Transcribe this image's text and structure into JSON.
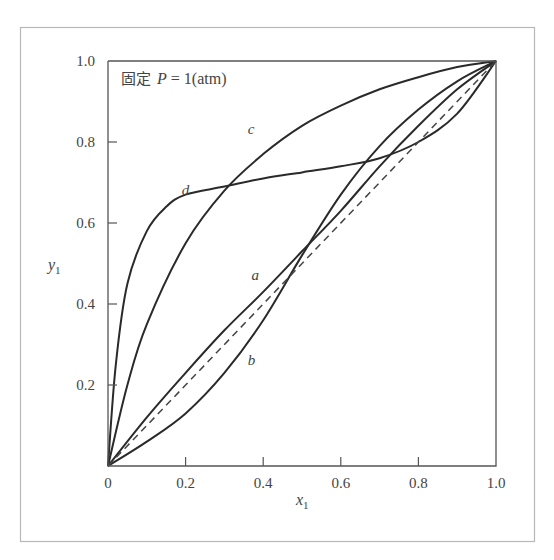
{
  "chart_data": {
    "type": "line",
    "title": "",
    "annotation": {
      "prefix": "固定",
      "variable": "P",
      "equals": " = ",
      "value": "1(atm)"
    },
    "xlabel": "x",
    "xlabel_sub": "1",
    "ylabel": "y",
    "ylabel_sub": "1",
    "xlim": [
      0,
      1.0
    ],
    "ylim": [
      0,
      1.0
    ],
    "x_ticks": [
      "0",
      "0.2",
      "0.4",
      "0.6",
      "0.8",
      "1.0"
    ],
    "y_ticks": [
      "0.2",
      "0.4",
      "0.6",
      "0.8",
      "1.0"
    ],
    "grid": false,
    "legend": "inline curve labels",
    "series": [
      {
        "name": "a",
        "style": "solid",
        "x": [
          0,
          0.1,
          0.2,
          0.3,
          0.4,
          0.5,
          0.6,
          0.7,
          0.8,
          0.9,
          1.0
        ],
        "y": [
          0,
          0.12,
          0.23,
          0.335,
          0.43,
          0.53,
          0.63,
          0.74,
          0.84,
          0.93,
          1.0
        ]
      },
      {
        "name": "b",
        "style": "solid",
        "x": [
          0,
          0.1,
          0.2,
          0.3,
          0.4,
          0.5,
          0.6,
          0.7,
          0.8,
          0.9,
          1.0
        ],
        "y": [
          0,
          0.06,
          0.13,
          0.23,
          0.36,
          0.52,
          0.67,
          0.79,
          0.88,
          0.95,
          1.0
        ]
      },
      {
        "name": "c",
        "style": "solid",
        "x": [
          0,
          0.05,
          0.1,
          0.2,
          0.3,
          0.4,
          0.5,
          0.6,
          0.7,
          0.8,
          0.9,
          1.0
        ],
        "y": [
          0,
          0.2,
          0.35,
          0.55,
          0.68,
          0.77,
          0.84,
          0.89,
          0.93,
          0.96,
          0.985,
          1.0
        ]
      },
      {
        "name": "d",
        "style": "solid",
        "x": [
          0,
          0.02,
          0.05,
          0.1,
          0.15,
          0.2,
          0.3,
          0.4,
          0.5,
          0.6,
          0.7,
          0.8,
          0.9,
          1.0
        ],
        "y": [
          0,
          0.25,
          0.45,
          0.58,
          0.64,
          0.67,
          0.69,
          0.71,
          0.725,
          0.74,
          0.76,
          0.8,
          0.87,
          1.0
        ]
      },
      {
        "name": "y=x",
        "style": "dashed",
        "x": [
          0,
          1.0
        ],
        "y": [
          0,
          1.0
        ]
      }
    ],
    "curve_labels": [
      {
        "text": "a",
        "x": 0.37,
        "y": 0.46
      },
      {
        "text": "b",
        "x": 0.36,
        "y": 0.25
      },
      {
        "text": "c",
        "x": 0.36,
        "y": 0.82
      },
      {
        "text": "d",
        "x": 0.19,
        "y": 0.67
      }
    ]
  }
}
